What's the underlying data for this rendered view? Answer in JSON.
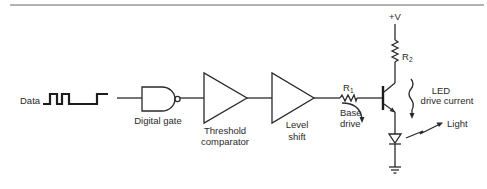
{
  "figure": {
    "type": "block-and-circuit diagram",
    "rule_color": "#9a9a9a",
    "line_color": "#2a2a2a"
  },
  "input": {
    "label": "Data",
    "waveform": "digital pulse train"
  },
  "blocks": [
    {
      "id": "digital-gate",
      "symbol": "NAND gate",
      "label_lines": [
        "Digital gate"
      ]
    },
    {
      "id": "threshold-comparator",
      "symbol": "triangle buffer",
      "label_lines": [
        "Threshold",
        "comparator"
      ]
    },
    {
      "id": "level-shift",
      "symbol": "triangle buffer",
      "label_lines": [
        "Level",
        "shift"
      ]
    }
  ],
  "components": {
    "r1": {
      "label": "R",
      "subscript": "1"
    },
    "r2": {
      "label": "R",
      "subscript": "2"
    },
    "supply": {
      "label": "+V"
    },
    "transistor": {
      "type": "NPN"
    },
    "led": {
      "type": "diode"
    },
    "ground": {
      "type": "ground"
    }
  },
  "annotations": {
    "base_drive": [
      "Base",
      "drive"
    ],
    "led_current": [
      "LED",
      "drive current"
    ],
    "light": "Light"
  }
}
